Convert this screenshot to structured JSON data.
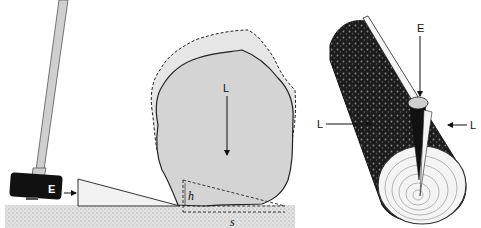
{
  "diagram": {
    "type": "physics-illustration",
    "panels": [
      {
        "id": "wedge-lifting-rock",
        "labels": {
          "effort": "E",
          "load": "L",
          "height": "h",
          "distance": "s"
        }
      },
      {
        "id": "wedge-splitting-log",
        "labels": {
          "effort": "E",
          "load_left": "L",
          "load_right": "L"
        }
      }
    ]
  },
  "colors": {
    "ground": "#d9d9d9",
    "rock": "#d4d4d4",
    "rock_displaced": "#e6e6e6",
    "hammer_head": "#111111",
    "handle": "#cfcfcf",
    "wedge": "#f0f0f0",
    "log_bark": "#1a1a1a",
    "log_end": "#f4f4f4"
  }
}
